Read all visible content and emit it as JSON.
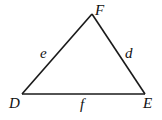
{
  "diagram": {
    "type": "triangle",
    "vertices": [
      {
        "name": "D",
        "x": 22,
        "y": 94,
        "label_x": 9,
        "label_y": 108
      },
      {
        "name": "E",
        "x": 145,
        "y": 94,
        "label_x": 143,
        "label_y": 108
      },
      {
        "name": "F",
        "x": 92,
        "y": 14,
        "label_x": 95,
        "label_y": 15
      }
    ],
    "sides": [
      {
        "name": "e",
        "from": "D",
        "to": "F",
        "label_x": 40,
        "label_y": 58
      },
      {
        "name": "d",
        "from": "F",
        "to": "E",
        "label_x": 125,
        "label_y": 58
      },
      {
        "name": "f",
        "from": "D",
        "to": "E",
        "label_x": 80,
        "label_y": 109
      }
    ],
    "stroke_color": "#1a1a1a"
  }
}
